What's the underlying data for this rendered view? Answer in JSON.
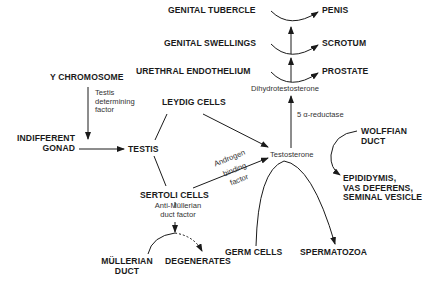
{
  "diagram": {
    "colors": {
      "ink": "#1a1a1a",
      "background": "#ffffff"
    },
    "nodes": {
      "genital_tubercle": "GENITAL TUBERCLE",
      "penis": "PENIS",
      "genital_swellings": "GENITAL SWELLINGS",
      "scrotum": "SCROTUM",
      "urethral_endothelium": "URETHRAL ENDOTHELIUM",
      "prostate": "PROSTATE",
      "dihydrotestosterone": "Dihydrotestosterone",
      "y_chromosome": "Y CHROMOSOME",
      "leydig_cells": "LEYDIG CELLS",
      "indifferent_gonad": "INDIFFERENT\nGONAD",
      "testis": "TESTIS",
      "testosterone": "Testosterone",
      "wolffian_duct": "WOLFFIAN\nDUCT",
      "epididymis": "EPIDIDYMIS,\nVAS DEFERENS,\nSEMINAL VESICLE",
      "sertoli_cells": "SERTOLI CELLS",
      "mullerian_duct": "MÜLLERIAN\nDUCT",
      "degenerates": "DEGENERATES",
      "germ_cells": "GERM CELLS",
      "spermatozoa": "SPERMATOZOA"
    },
    "edge_labels": {
      "testis_determining_factor": "Testis\ndetermining\nfactor",
      "five_alpha_reductase": "5 α-reductase",
      "androgen_binding_factor_1": "Androgen",
      "androgen_binding_factor_2": "binding",
      "androgen_binding_factor_3": "factor",
      "anti_mullerian_duct_factor": "Anti-Müllerian\nduct factor"
    }
  }
}
